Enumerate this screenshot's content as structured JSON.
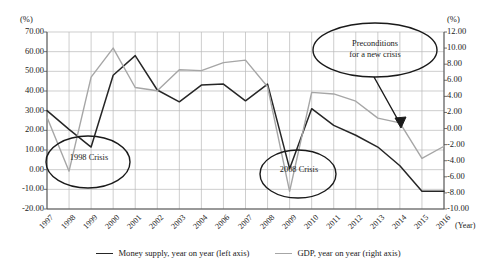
{
  "chart_data": {
    "type": "line",
    "title": "",
    "xlabel": "(Year)",
    "ylabel": "(%)",
    "ylabel_right": "(%)",
    "grid": true,
    "legend_position": "bottom",
    "categories": [
      "1997",
      "1998",
      "1999",
      "2000",
      "2001",
      "2002",
      "2003",
      "2004",
      "2006",
      "2007",
      "2008",
      "2009",
      "2010",
      "2011",
      "2012",
      "2013",
      "2014",
      "2015",
      "2016"
    ],
    "x_tick_labels": [
      "1997",
      "1998",
      "1999",
      "2000",
      "2001",
      "2002",
      "2003",
      "2004",
      "2006",
      "2007",
      "2008",
      "2009",
      "2010",
      "2011",
      "2012",
      "2013",
      "2014",
      "2015",
      "2016"
    ],
    "ylim": [
      -20,
      70
    ],
    "y_ticks": [
      70.0,
      60.0,
      50.0,
      40.0,
      30.0,
      20.0,
      10.0,
      0.0,
      -10.0,
      -20.0
    ],
    "y_tick_labels": [
      "70.00",
      "60.00",
      "50.00",
      "40.00",
      "30.00",
      "20.00",
      "10.00",
      "0.00",
      "-10.00",
      "-20.00"
    ],
    "ylim_right": [
      -10,
      12
    ],
    "y_ticks_right": [
      12.0,
      10.0,
      8.0,
      6.0,
      4.0,
      2.0,
      0.0,
      -2.0,
      -4.0,
      -6.0,
      -8.0,
      -10.0
    ],
    "y_tick_labels_right": [
      "12.00",
      "10.00",
      "8.00",
      "6.00",
      "4.00",
      "2.00",
      "0.00",
      "-2.00",
      "-4.00",
      "-6.00",
      "-8.00",
      "-10.00"
    ],
    "series": [
      {
        "name": "Money supply, year on year (left axis)",
        "axis": "left",
        "color": "#262626",
        "values": [
          30.0,
          20.5,
          11.5,
          48.0,
          58.0,
          40.5,
          34.5,
          43.0,
          43.5,
          35.0,
          43.5,
          0.5,
          31.0,
          22.5,
          17.5,
          11.5,
          2.0,
          -11.0,
          -11.0
        ]
      },
      {
        "name": "GDP, year on year (right axis)",
        "axis": "right",
        "color": "#a6a6a6",
        "values": [
          1.4,
          -5.3,
          6.4,
          10.0,
          5.1,
          4.7,
          7.3,
          7.2,
          8.2,
          8.5,
          5.2,
          -7.8,
          4.5,
          4.3,
          3.4,
          1.3,
          0.7,
          -3.7,
          -2.2
        ]
      }
    ],
    "annotations": [
      {
        "id": "1998-crisis",
        "label": "1998 Crisis",
        "shape": "ellipse"
      },
      {
        "id": "2008-crisis",
        "label": "2008 Crisis",
        "shape": "ellipse"
      },
      {
        "id": "preconditions",
        "label_line1": "Preconditions",
        "label_line2": "for a new crisis",
        "shape": "ellipse-with-arrow"
      }
    ]
  },
  "colors": {
    "money_supply": "#262626",
    "gdp": "#a6a6a6",
    "grid": "#b9b9b9",
    "axis": "#4d4d4d",
    "annotation": "#1a1a1a"
  }
}
